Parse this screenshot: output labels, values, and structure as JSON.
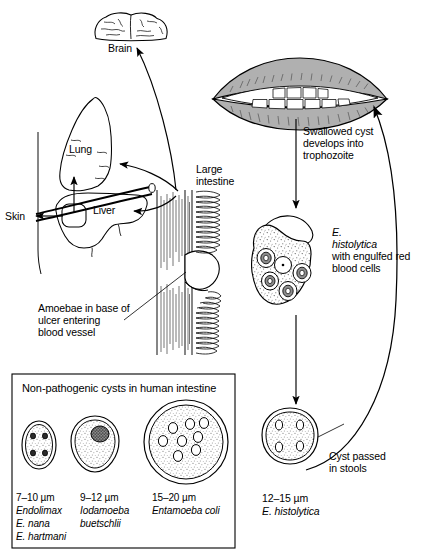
{
  "diagram": {
    "type": "biological-life-cycle"
  },
  "organs": {
    "brain_label": "Brain",
    "lung_label": "Lung",
    "liver_label": "Liver",
    "skin_label": "Skin",
    "large_intestine_label": "Large\nintestine",
    "large_intestine_line1": "Large",
    "large_intestine_line2": "intestine"
  },
  "annotations": {
    "ulcer": "Amoebae in base of\nulcer entering\nblood vessel",
    "ulcer_line1": "Amoebae in base of",
    "ulcer_line2": "ulcer entering",
    "ulcer_line3": "blood vessel",
    "swallowed": "Swallowed cyst\ndevelops into\ntrophozoite",
    "swallowed_line1": "Swallowed cyst",
    "swallowed_line2": "develops into",
    "swallowed_line3": "trophozoite",
    "trophozoite_name_line1": "E.",
    "trophozoite_name_line2": "histolytica",
    "trophozoite_desc_line1": "with engulfed red",
    "trophozoite_desc_line2": "blood cells",
    "cyst_passed_line1": "Cyst passed",
    "cyst_passed_line2": "in stools",
    "cyst_size": "12–15 µm",
    "cyst_species": "E. histolytica"
  },
  "inset": {
    "heading": "Non-pathogenic cysts in human intestine",
    "cysts": [
      {
        "size": "7–10 µm",
        "genus": "Endolimax",
        "species_line1": "E. nana",
        "species_line2": "E. hartmani",
        "shape": "oval",
        "nuclei": 4
      },
      {
        "size": "9–12 µm",
        "genus": "Iodamoeba",
        "species_line1": "buetschlii",
        "species_line2": "",
        "shape": "teardrop",
        "nuclei": 1
      },
      {
        "size": "15–20 µm",
        "genus": "Entamoeba coli",
        "species_line1": "",
        "species_line2": "",
        "shape": "round",
        "nuclei": 8
      }
    ]
  },
  "colors": {
    "stroke": "#000000",
    "lip_fill": "#a8a8a8",
    "lip_fill_light": "#bcbcbc",
    "tooth_fill": "#ffffff",
    "stipple": "#555555",
    "background": "#ffffff"
  },
  "icons": {
    "brain": "brain-icon",
    "lung": "lung-icon",
    "liver": "liver-icon",
    "mouth": "mouth-icon",
    "intestine": "intestine-icon",
    "trophozoite": "trophozoite-icon",
    "cyst": "cyst-icon",
    "arrow": "arrow-icon"
  }
}
